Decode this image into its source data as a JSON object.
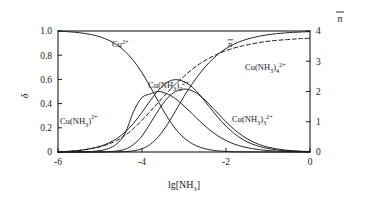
{
  "chart_data": {
    "type": "line",
    "title": "",
    "xlabel": "lg[NH3]",
    "ylabel": "delta",
    "y2label": "n-bar",
    "xlim": [
      -6,
      0
    ],
    "ylim": [
      0,
      1.0
    ],
    "y2lim": [
      0,
      4
    ],
    "grid": false,
    "legend": "inline-labels",
    "xticks": [
      "-6",
      "-4",
      "-2",
      "0"
    ],
    "xtick_values": [
      -6,
      -4,
      -2,
      0
    ],
    "yticks": [
      "0",
      "0.2",
      "0.4",
      "0.6",
      "0.8",
      "1.0"
    ],
    "ytick_values": [
      0,
      0.2,
      0.4,
      0.6,
      0.8,
      1.0
    ],
    "y2ticks": [
      "0",
      "1",
      "2",
      "3",
      "4"
    ],
    "y2tick_values": [
      0,
      1,
      2,
      3,
      4
    ],
    "x": [
      -6.0,
      -5.8,
      -5.6,
      -5.4,
      -5.2,
      -5.0,
      -4.8,
      -4.6,
      -4.4,
      -4.2,
      -4.0,
      -3.8,
      -3.6,
      -3.4,
      -3.2,
      -3.0,
      -2.8,
      -2.6,
      -2.4,
      -2.2,
      -2.0,
      -1.8,
      -1.6,
      -1.4,
      -1.2,
      -1.0,
      -0.8,
      -0.6,
      -0.4,
      -0.2,
      0.0
    ],
    "series": [
      {
        "name": "Cu2+",
        "style": "solid",
        "axis": "left",
        "values": [
          1.0,
          0.995,
          0.99,
          0.982,
          0.97,
          0.952,
          0.925,
          0.886,
          0.83,
          0.754,
          0.655,
          0.537,
          0.41,
          0.29,
          0.19,
          0.117,
          0.068,
          0.037,
          0.019,
          0.0094,
          0.0045,
          0.0021,
          0.00095,
          0.00042,
          0.00018,
          8e-05,
          3e-05,
          1e-05,
          4e-06,
          1.5e-06,
          5e-07
        ]
      },
      {
        "name": "Cu(NH3)2+",
        "style": "solid",
        "axis": "left",
        "values": [
          0.0,
          0.004,
          0.009,
          0.017,
          0.03,
          0.047,
          0.073,
          0.111,
          0.165,
          0.238,
          0.328,
          0.426,
          0.514,
          0.576,
          0.598,
          0.581,
          0.535,
          0.462,
          0.375,
          0.29,
          0.214,
          0.152,
          0.104,
          0.069,
          0.045,
          0.029,
          0.018,
          0.011,
          0.007,
          0.0041,
          0.0025
        ]
      },
      {
        "name": "Cu(NH3)2 2+",
        "style": "solid",
        "axis": "left",
        "values": [
          0.0,
          0.0002,
          0.0006,
          0.0017,
          0.0045,
          0.0116,
          0.0283,
          0.0676,
          0.156,
          0.336,
          0.45,
          0.48,
          0.5,
          0.48,
          0.44,
          0.38,
          0.315,
          0.247,
          0.186,
          0.135,
          0.095,
          0.065,
          0.044,
          0.029,
          0.019,
          0.012,
          0.0077,
          0.0048,
          0.003,
          0.0019,
          0.0012
        ]
      },
      {
        "name": "Cu(NH3)3 2+",
        "style": "solid",
        "axis": "left",
        "values": [
          0.0,
          0.0,
          0.0,
          0.0001,
          0.0003,
          0.0009,
          0.0027,
          0.008,
          0.023,
          0.062,
          0.133,
          0.238,
          0.35,
          0.443,
          0.5,
          0.52,
          0.505,
          0.46,
          0.395,
          0.322,
          0.25,
          0.185,
          0.132,
          0.091,
          0.061,
          0.04,
          0.026,
          0.016,
          0.01,
          0.0064,
          0.004
        ]
      },
      {
        "name": "Cu(NH3)4 2+",
        "style": "solid",
        "axis": "left",
        "values": [
          0.0,
          0.0,
          0.0,
          0.0,
          0.0,
          0.0001,
          0.0003,
          0.001,
          0.003,
          0.01,
          0.027,
          0.064,
          0.13,
          0.225,
          0.34,
          0.46,
          0.565,
          0.66,
          0.74,
          0.805,
          0.855,
          0.893,
          0.921,
          0.942,
          0.958,
          0.969,
          0.978,
          0.984,
          0.989,
          0.992,
          0.995
        ]
      },
      {
        "name": "n-bar",
        "style": "dashed",
        "axis": "right",
        "values": [
          0.0,
          0.02,
          0.04,
          0.07,
          0.11,
          0.17,
          0.26,
          0.38,
          0.55,
          0.78,
          1.05,
          1.35,
          1.66,
          1.96,
          2.25,
          2.5,
          2.74,
          2.94,
          3.1,
          3.24,
          3.35,
          3.44,
          3.51,
          3.57,
          3.62,
          3.66,
          3.69,
          3.71,
          3.73,
          3.75,
          3.76
        ]
      }
    ],
    "annotations": [
      {
        "id": "label-cu2",
        "text_parts": {
          "base": "Cu",
          "sup": "2+"
        },
        "x_px": 112,
        "y_px": 47
      },
      {
        "id": "label-cu-nh3-1",
        "text_parts": {
          "base": "Cu(NH",
          "sub": "3",
          "close": ")",
          "sup": "2+"
        },
        "x_px": 60,
        "y_px": 124
      },
      {
        "id": "label-cu-nh3-2",
        "text_parts": {
          "base": "Cu(NH",
          "sub": "3",
          "close": ")",
          "sub2": "2",
          "sup": "2+"
        },
        "x_px": 148,
        "y_px": 88
      },
      {
        "id": "label-cu-nh3-3",
        "text_parts": {
          "base": "Cu(NH",
          "sub": "3",
          "close": ")",
          "sub2": "3",
          "sup": "2+"
        },
        "x_px": 232,
        "y_px": 122
      },
      {
        "id": "label-cu-nh3-4",
        "text_parts": {
          "base": "Cu(NH",
          "sub": "3",
          "close": ")",
          "sub2": "4",
          "sup": "2+"
        },
        "x_px": 245,
        "y_px": 70
      },
      {
        "id": "label-n-bar",
        "text_parts": {
          "base": "n"
        },
        "x_px": 228,
        "y_px": 47
      }
    ]
  },
  "axes": {
    "left_title": "δ",
    "right_title": "n",
    "x_title_parts": {
      "base": "lg[NH",
      "sub": "3",
      "close": "]"
    }
  },
  "colors": {
    "curve": "#1a1a1a",
    "axis": "#1a1a1a",
    "background": "#ffffff",
    "text": "#1a1a1a"
  }
}
